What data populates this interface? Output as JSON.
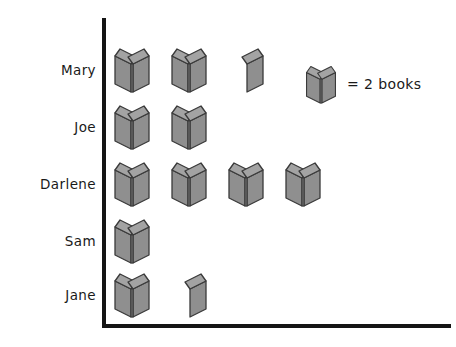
{
  "chart_data": {
    "type": "bar",
    "subtype": "pictograph",
    "title": "",
    "xlabel": "",
    "ylabel": "",
    "categories": [
      "Mary",
      "Joe",
      "Darlene",
      "Sam",
      "Jane"
    ],
    "values": [
      5,
      4,
      8,
      2,
      3
    ],
    "icon_counts": [
      2.5,
      2,
      4,
      1,
      1.5
    ],
    "unit_value": 2,
    "unit_label": "books",
    "legend": "= 2 books",
    "grid": false,
    "legend_position": "top-right",
    "axes": {
      "y_axis_visible": true,
      "x_axis_visible": true,
      "tick_labels": false
    }
  },
  "labels": {
    "mary": "Mary",
    "joe": "Joe",
    "darlene": "Darlene",
    "sam": "Sam",
    "jane": "Jane"
  },
  "legend": {
    "equals_text": "= 2 books",
    "icon_name": "book-icon"
  },
  "colors": {
    "book_fill": "#8f8f8f",
    "book_fill_light": "#a3a3a3",
    "book_outline": "#3a3a3a",
    "axis": "#151515",
    "text": "#1a1a1a",
    "background": "#ffffff"
  },
  "rows": [
    {
      "name": "Mary",
      "full": 2,
      "half": 1,
      "top": 44
    },
    {
      "name": "Joe",
      "full": 2,
      "half": 0,
      "top": 101
    },
    {
      "name": "Darlene",
      "full": 4,
      "half": 0,
      "top": 158
    },
    {
      "name": "Sam",
      "full": 1,
      "half": 0,
      "top": 215
    },
    {
      "name": "Jane",
      "full": 1,
      "half": 1,
      "top": 269
    }
  ]
}
